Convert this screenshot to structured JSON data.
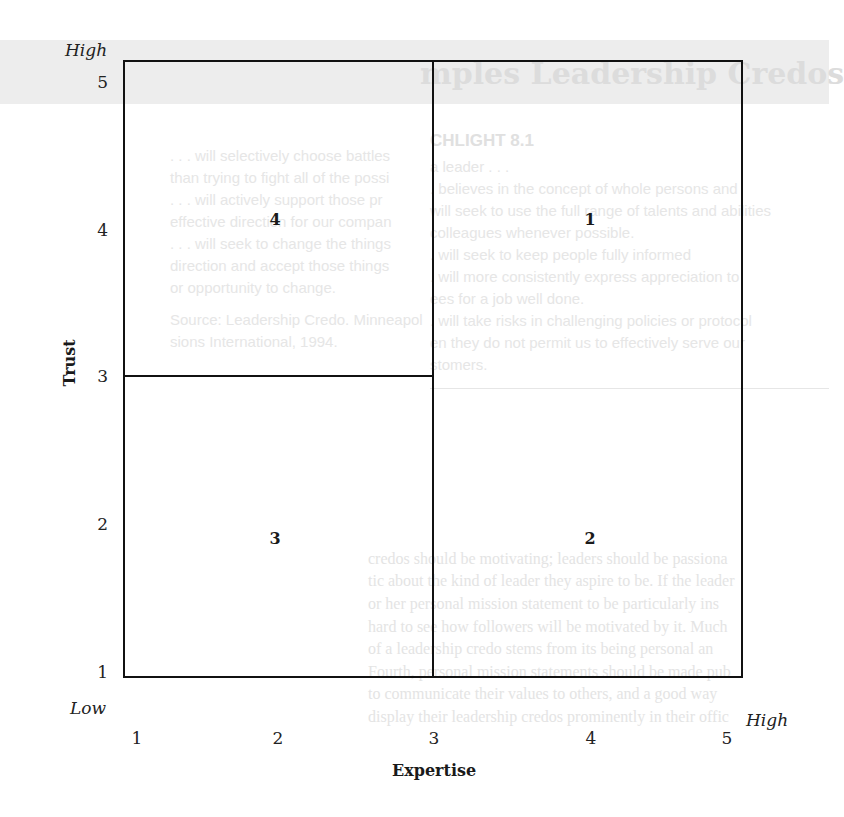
{
  "diagram": {
    "y_axis": {
      "title": "Trust",
      "low_label": "Low",
      "high_label": "High",
      "ticks": [
        "5",
        "4",
        "3",
        "2",
        "1"
      ]
    },
    "x_axis": {
      "title": "Expertise",
      "high_label": "High",
      "ticks": [
        "1",
        "2",
        "3",
        "4",
        "5"
      ]
    },
    "cells": {
      "upper_left_outer": "4",
      "upper_right": "1",
      "lower_left_outer": "3",
      "lower_right": "2"
    }
  },
  "background_page": {
    "title_fragment": "mples Leadership Credos",
    "exhibit_heading": "CHLIGHT 8.1",
    "left_column": [
      ". . . will selectively choose battles",
      "than trying to fight all of the possi",
      ". . . will actively support those pr",
      "effective direction for our compan",
      ". . . will seek to change the things",
      "direction and accept those things",
      "or opportunity to change.",
      "Source: Leadership Credo. Minneapol",
      "sions International, 1994."
    ],
    "right_column": [
      "a leader . . .",
      ". believes in the concept of whole persons and",
      "will seek to use the full range of talents and abilities",
      "colleagues whenever possible.",
      ". will seek to keep people fully informed",
      ". will more consistently express appreciation to",
      "ees for a job well done.",
      ". will take risks in challenging policies or protocol",
      "en they do not permit us to effectively serve our",
      "stomers."
    ],
    "body_paragraph": [
      "credos should be motivating; leaders should be passiona",
      "tic about the kind of leader they aspire to be. If the leader",
      "or her personal mission statement to be particularly ins",
      "hard to see how followers will be motivated by it. Much",
      "of a leadership credo stems from its being personal an",
      "Fourth, personal mission statements should be made pub",
      "to communicate their values to others, and a good way",
      "display their leadership credos prominently in their offic"
    ]
  }
}
